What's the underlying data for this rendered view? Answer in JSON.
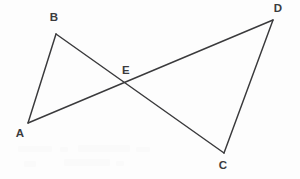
{
  "figure": {
    "width": 300,
    "height": 179,
    "background_color": "#fdfdfd",
    "stroke_color": "#3a3a3c",
    "stroke_width": 1.45,
    "label_color": "#3b3b3d",
    "label_font_size": 11.5
  },
  "points": {
    "A": {
      "label": "A",
      "x": 28,
      "y": 123,
      "label_x": 20,
      "label_y": 134
    },
    "B": {
      "label": "B",
      "x": 56,
      "y": 34,
      "label_x": 54,
      "label_y": 18
    },
    "C": {
      "label": "C",
      "x": 224,
      "y": 153,
      "label_x": 223,
      "label_y": 166
    },
    "D": {
      "label": "D",
      "x": 273,
      "y": 20,
      "label_x": 278,
      "label_y": 9
    },
    "E": {
      "label": "E",
      "x": 127,
      "y": 84,
      "label_x": 126,
      "label_y": 71
    }
  },
  "segments": [
    {
      "name": "segment-AB",
      "from": "A",
      "to": "B",
      "path": "M 28 123 L 56 34"
    },
    {
      "name": "segment-BC",
      "from": "B",
      "to": "C",
      "path": "M 56 34 L 224 153"
    },
    {
      "name": "segment-AD",
      "from": "A",
      "to": "D",
      "path": "M 28 123 L 273 20"
    },
    {
      "name": "segment-DC",
      "from": "D",
      "to": "C",
      "path": "M 273 20 L 224 153"
    }
  ],
  "artifacts": {
    "description": "faint scanner ghost marks in lower-left area",
    "marks": [
      {
        "x": 18,
        "y": 146,
        "w": 34,
        "h": 6
      },
      {
        "x": 60,
        "y": 147,
        "w": 8,
        "h": 5
      },
      {
        "x": 78,
        "y": 145,
        "w": 52,
        "h": 7
      },
      {
        "x": 136,
        "y": 147,
        "w": 14,
        "h": 5
      },
      {
        "x": 24,
        "y": 161,
        "w": 12,
        "h": 6
      },
      {
        "x": 64,
        "y": 159,
        "w": 46,
        "h": 7
      },
      {
        "x": 116,
        "y": 161,
        "w": 8,
        "h": 5
      }
    ]
  }
}
